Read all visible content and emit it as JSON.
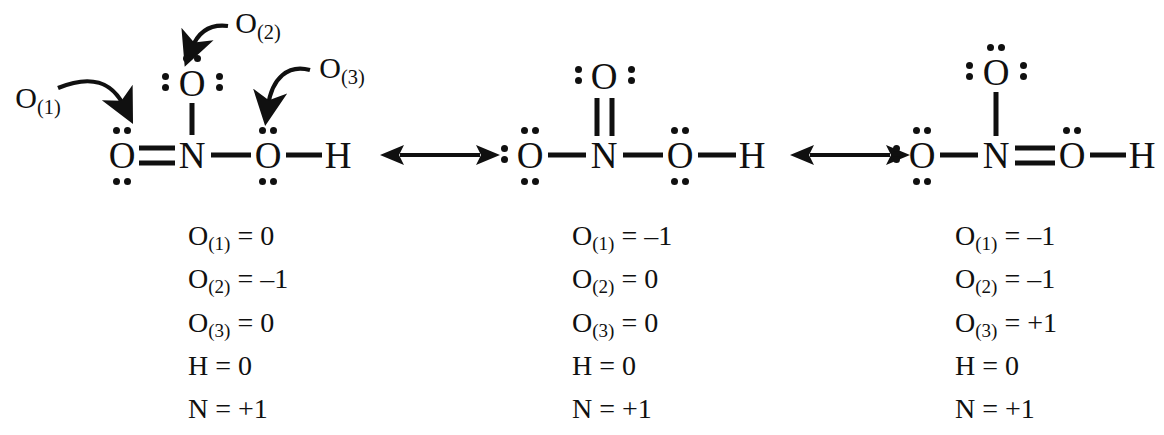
{
  "diagram": {
    "atom_labels": {
      "O": "O",
      "N": "N",
      "H": "H"
    },
    "callouts": [
      {
        "id": "o1",
        "label": "O",
        "subscript": "(1)"
      },
      {
        "id": "o2",
        "label": "O",
        "subscript": "(2)"
      },
      {
        "id": "o3",
        "label": "O",
        "subscript": "(3)"
      }
    ],
    "resonance_arrow_symbol": "double-headed-arrow",
    "structures": [
      {
        "id": "structure-1",
        "atoms": {
          "left_oxygen": "O",
          "nitrogen": "N",
          "top_oxygen": "O",
          "right_oxygen": "O",
          "hydrogen": "H"
        },
        "bonds": {
          "n_to_left_oxygen": "double",
          "n_to_top_oxygen": "single",
          "n_to_right_oxygen": "single",
          "right_oxygen_to_hydrogen": "single"
        },
        "lone_pairs": {
          "left_oxygen": 2,
          "top_oxygen": 3,
          "right_oxygen": 2
        },
        "charges": [
          {
            "species": "O",
            "subscript": "(1)",
            "value": "0"
          },
          {
            "species": "O",
            "subscript": "(2)",
            "value": "–1"
          },
          {
            "species": "O",
            "subscript": "(3)",
            "value": "0"
          },
          {
            "species": "H",
            "subscript": "",
            "value": "0"
          },
          {
            "species": "N",
            "subscript": "",
            "value": "+1"
          }
        ]
      },
      {
        "id": "structure-2",
        "atoms": {
          "left_oxygen": "O",
          "nitrogen": "N",
          "top_oxygen": "O",
          "right_oxygen": "O",
          "hydrogen": "H"
        },
        "bonds": {
          "n_to_left_oxygen": "single",
          "n_to_top_oxygen": "double",
          "n_to_right_oxygen": "single",
          "right_oxygen_to_hydrogen": "single"
        },
        "lone_pairs": {
          "left_oxygen": 3,
          "top_oxygen": 2,
          "right_oxygen": 2
        },
        "charges": [
          {
            "species": "O",
            "subscript": "(1)",
            "value": "–1"
          },
          {
            "species": "O",
            "subscript": "(2)",
            "value": "0"
          },
          {
            "species": "O",
            "subscript": "(3)",
            "value": "0"
          },
          {
            "species": "H",
            "subscript": "",
            "value": "0"
          },
          {
            "species": "N",
            "subscript": "",
            "value": "+1"
          }
        ]
      },
      {
        "id": "structure-3",
        "atoms": {
          "left_oxygen": "O",
          "nitrogen": "N",
          "top_oxygen": "O",
          "right_oxygen": "O",
          "hydrogen": "H"
        },
        "bonds": {
          "n_to_left_oxygen": "single",
          "n_to_top_oxygen": "single",
          "n_to_right_oxygen": "double",
          "right_oxygen_to_hydrogen": "single"
        },
        "lone_pairs": {
          "left_oxygen": 3,
          "top_oxygen": 3,
          "right_oxygen": 1
        },
        "charges": [
          {
            "species": "O",
            "subscript": "(1)",
            "value": "–1"
          },
          {
            "species": "O",
            "subscript": "(2)",
            "value": "–1"
          },
          {
            "species": "O",
            "subscript": "(3)",
            "value": "+1"
          },
          {
            "species": "H",
            "subscript": "",
            "value": "0"
          },
          {
            "species": "N",
            "subscript": "",
            "value": "+1"
          }
        ]
      }
    ],
    "colors": {
      "ink": "#101010",
      "background": "#ffffff"
    }
  }
}
